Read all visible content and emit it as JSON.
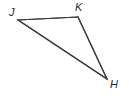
{
  "figure": {
    "type": "geometry-diagram",
    "shape": "triangle",
    "background_color": "#ffffff",
    "stroke_color": "#3a3a3a",
    "stroke_width": 1.2,
    "label_color": "#2b2b2b",
    "canvas": {
      "width": 129,
      "height": 98
    },
    "vertices": [
      {
        "id": "J",
        "label": "J",
        "x": 18,
        "y": 20,
        "label_x": 9,
        "label_y": 7
      },
      {
        "id": "K",
        "label": "K",
        "x": 78,
        "y": 17,
        "label_x": 75,
        "label_y": 2
      },
      {
        "id": "H",
        "label": "H",
        "x": 107,
        "y": 79,
        "label_x": 110,
        "label_y": 79
      }
    ],
    "edges": [
      {
        "id": "JK",
        "from": "J",
        "to": "K",
        "path": "18,20 78,17"
      },
      {
        "id": "KH",
        "from": "K",
        "to": "H",
        "path": "78,17 107,79"
      },
      {
        "id": "JH",
        "from": "J",
        "to": "H",
        "path": "18,20 107,79"
      }
    ],
    "polygon_points": "18,20 78,17 107,79"
  }
}
